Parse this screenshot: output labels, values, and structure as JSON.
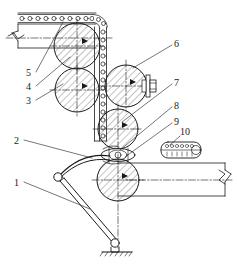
{
  "diagram": {
    "type": "engineering-line-drawing",
    "line_color": "#1a1a1a",
    "hatch_color": "#555555",
    "background": "#ffffff"
  },
  "callouts": [
    {
      "id": "1",
      "label": "1",
      "x": 14,
      "y": 184,
      "leader_to_x": 90,
      "leader_to_y": 209
    },
    {
      "id": "2",
      "label": "2",
      "x": 14,
      "y": 142,
      "leader_to_x": 92,
      "leader_to_y": 158
    },
    {
      "id": "3",
      "label": "3",
      "x": 27,
      "y": 103,
      "leader_to_x": 63,
      "leader_to_y": 83
    },
    {
      "id": "4",
      "label": "4",
      "x": 27,
      "y": 89,
      "leader_to_x": 68,
      "leader_to_y": 58
    },
    {
      "id": "5",
      "label": "5",
      "x": 27,
      "y": 75,
      "leader_to_x": 63,
      "leader_to_y": 22
    },
    {
      "id": "6",
      "label": "6",
      "x": 174,
      "y": 46,
      "leader_to_x": 131,
      "leader_to_y": 68
    },
    {
      "id": "7",
      "label": "7",
      "x": 174,
      "y": 85,
      "leader_to_x": 120,
      "leader_to_y": 122
    },
    {
      "id": "8",
      "label": "8",
      "x": 174,
      "y": 108,
      "leader_to_x": 119,
      "leader_to_y": 148
    },
    {
      "id": "9",
      "label": "9",
      "x": 174,
      "y": 124,
      "leader_to_x": 120,
      "leader_to_y": 155
    },
    {
      "id": "10",
      "label": "10",
      "x": 180,
      "y": 133,
      "leader_to_x": 168,
      "leader_to_y": 147
    }
  ],
  "parts": {
    "chain_belt": "chain-belt-with-rollers",
    "roller_top_left": "hatched-roller",
    "roller_mid_left": "hatched-roller",
    "roller_mid_right": "hatched-roller-with-bearing",
    "roller_lower": "hatched-roller",
    "roller_bottom": "hatched-roller",
    "nip_roller": "small-nip-roller",
    "scraper_blade": "curved-scraper-blade",
    "lever_arm": "two-bar-lever-linkage",
    "pivot_base": "ground-pivot-support",
    "chain_link_detail": "chain-link-detail-box",
    "strip_left": "material-strip-left",
    "strip_right": "material-strip-right",
    "break_symbol_left": "break-line-symbol",
    "break_symbol_right": "break-line-symbol"
  }
}
